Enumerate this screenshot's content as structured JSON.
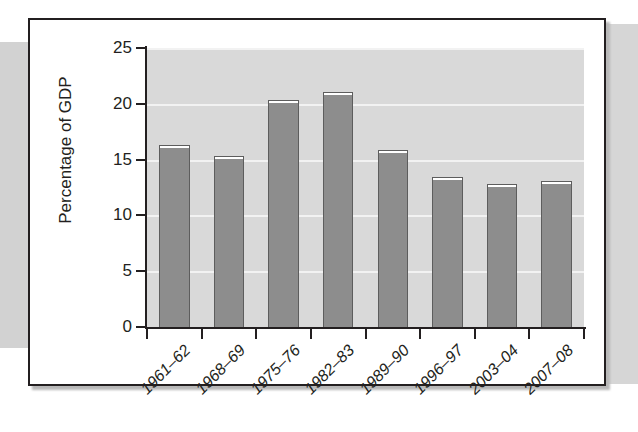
{
  "figure": {
    "frame_color": "#231f20",
    "plot_background": "#d9d9d9",
    "gridline_color": "#f2f2f2",
    "bar_fill": "#8d8d8d",
    "bar_border": "#5d5d5d"
  },
  "chart_data": {
    "type": "bar",
    "title": "",
    "subtitle": "",
    "xlabel": "",
    "ylabel": "Percentage of GDP",
    "ylim": [
      0,
      25
    ],
    "yticks": [
      0,
      5,
      10,
      15,
      20,
      25
    ],
    "ytick_labels": [
      "0",
      "5",
      "10",
      "15",
      "20",
      "25"
    ],
    "grid": true,
    "grid_axis": "y",
    "legend": false,
    "legend_position": "none",
    "categories": [
      "1961–62",
      "1968–69",
      "1975–76",
      "1982–83",
      "1989–90",
      "1996–97",
      "2003–04",
      "2007–08"
    ],
    "values": [
      16.3,
      15.3,
      20.3,
      21.1,
      15.9,
      13.4,
      12.8,
      13.1
    ],
    "series": [
      {
        "name": "Percentage of GDP",
        "values": [
          16.3,
          15.3,
          20.3,
          21.1,
          15.9,
          13.4,
          12.8,
          13.1
        ]
      }
    ]
  }
}
